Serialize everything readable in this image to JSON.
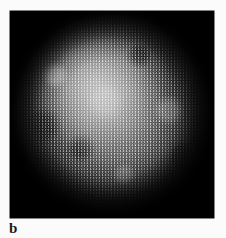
{
  "figure": {
    "panel_label": "b",
    "caption_label": "b",
    "background_color": "#fbfbfb",
    "panel": {
      "name": "grayscale-speckle-image",
      "background_color": "#000000",
      "x": 10,
      "y": 11,
      "width": 204,
      "height": 207
    }
  },
  "chart_data": {
    "type": "heatmap",
    "title": "",
    "subtitle": "",
    "xlabel": "",
    "ylabel": "",
    "annotations": [
      "b"
    ],
    "legend": [],
    "grid": false,
    "colormap": "grayscale",
    "background_color": "#000000",
    "field": {
      "width_px": 204,
      "height_px": 207,
      "min_intensity": 0,
      "max_intensity": 255
    },
    "blob": {
      "center_x_px": 95,
      "center_y_px": 109,
      "radius_x_px": 86,
      "radius_y_px": 88,
      "peak_intensity": 138,
      "core_intensity": 106,
      "edge_intensity": 18,
      "background_intensity": 4,
      "peak_offset_x_px": -18,
      "peak_offset_y_px": -24,
      "texture": "fine random speckle / granular noise",
      "speckle_amplitude": 42
    },
    "intensity_profile_horizontal": {
      "x": [
        0,
        10,
        20,
        30,
        40,
        50,
        60,
        70,
        80,
        90,
        100,
        110,
        120,
        130,
        140,
        150,
        160,
        170,
        180,
        190,
        200
      ],
      "values": [
        3,
        4,
        6,
        14,
        38,
        72,
        102,
        122,
        131,
        134,
        128,
        120,
        114,
        110,
        104,
        92,
        70,
        40,
        16,
        6,
        3
      ]
    },
    "intensity_profile_vertical": {
      "y": [
        0,
        10,
        20,
        30,
        40,
        50,
        60,
        70,
        80,
        90,
        100,
        110,
        120,
        130,
        140,
        150,
        160,
        170,
        180,
        190,
        200
      ],
      "values": [
        3,
        4,
        5,
        10,
        30,
        74,
        112,
        130,
        136,
        132,
        124,
        118,
        112,
        106,
        98,
        84,
        60,
        32,
        12,
        5,
        3
      ]
    }
  }
}
